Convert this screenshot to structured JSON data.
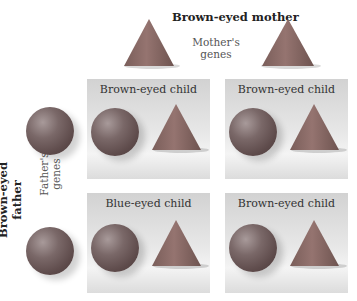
{
  "mother": {
    "title": "Brown-eyed mother",
    "genes_label_1": "Mother's",
    "genes_label_2": "genes"
  },
  "father": {
    "title": "Brown-eyed father",
    "genes_label_1": "Father's",
    "genes_label_2": "genes"
  },
  "panels": [
    {
      "label": "Brown-eyed child"
    },
    {
      "label": "Brown-eyed child"
    },
    {
      "label": "Blue-eyed child"
    },
    {
      "label": "Brown-eyed child"
    }
  ],
  "colors": {
    "cone": "#8a6560",
    "sphere": "#5e4b4b",
    "panel": "#e4e4e4"
  }
}
